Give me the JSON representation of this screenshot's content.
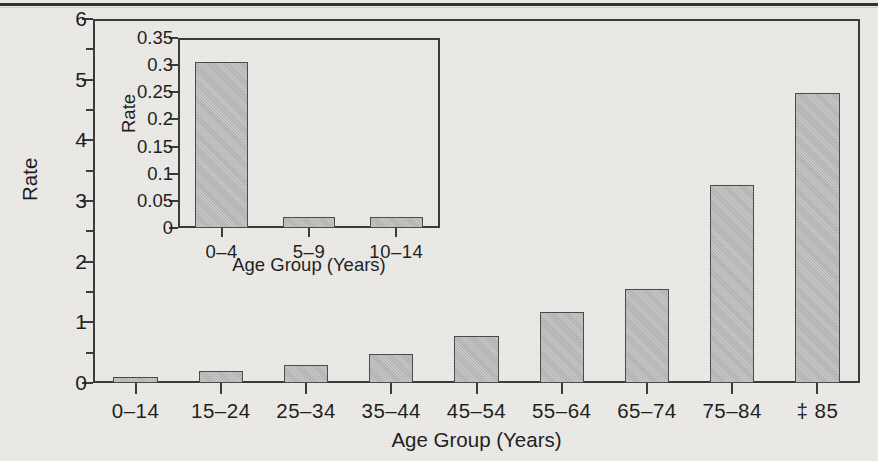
{
  "colors": {
    "background": "#ecebe7",
    "bar_fill": "#bcbcbc",
    "bar_stroke": "#4a4a4a",
    "axis": "#3a3a3a",
    "text": "#1d1d1d"
  },
  "chart_data": [
    {
      "id": "main",
      "type": "bar",
      "title": "",
      "xlabel": "Age Group (Years)",
      "ylabel": "Rate",
      "categories": [
        "0–14",
        "15–24",
        "25–34",
        "35–44",
        "45–54",
        "55–64",
        "65–74",
        "75–84",
        "‡50"
      ],
      "category_labels": [
        "0–14",
        "15–24",
        "25–34",
        "35–44",
        "45–54",
        "55–64",
        "65–74",
        "75–84",
        "‡ 85"
      ],
      "values": [
        0.1,
        0.2,
        0.29,
        0.48,
        0.78,
        1.17,
        1.55,
        3.27,
        4.78
      ],
      "ylim": [
        0,
        6
      ],
      "ytick_labels": [
        "0",
        "1",
        "2",
        "3",
        "4",
        "5",
        "6"
      ],
      "ytick_values": [
        0,
        1,
        2,
        3,
        4,
        5,
        6
      ],
      "yminor_values": [
        0.5,
        1.5,
        2.5,
        3.5,
        4.5,
        5.5
      ],
      "grid": false,
      "legend": "none"
    },
    {
      "id": "inset",
      "type": "bar",
      "title": "",
      "xlabel": "Age Group (Years)",
      "ylabel": "Rate",
      "categories": [
        "0–4",
        "5–9",
        "10–14"
      ],
      "category_labels": [
        "0–4",
        "5–9",
        "10–14"
      ],
      "values": [
        0.305,
        0.02,
        0.02
      ],
      "ylim": [
        0,
        0.35
      ],
      "ytick_labels": [
        "0",
        "0.05",
        "0.1",
        "0.15",
        "0.2",
        "0.25",
        "0.3",
        "0.35"
      ],
      "ytick_values": [
        0,
        0.05,
        0.1,
        0.15,
        0.2,
        0.25,
        0.3,
        0.35
      ],
      "grid": false,
      "legend": "none"
    }
  ]
}
